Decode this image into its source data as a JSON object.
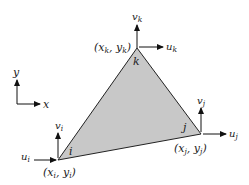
{
  "figure": {
    "colors": {
      "fill": "#c8c8c8",
      "stroke": "#222222",
      "background": "#ffffff"
    }
  },
  "axes": {
    "x_label": "x",
    "y_label": "y"
  },
  "nodes": {
    "i": {
      "label": "i",
      "coord_label": "(x",
      "coord_sub_x": "i",
      "coord_mid": ", y",
      "coord_sub_y": "i",
      "coord_end": ")",
      "u": "u",
      "u_sub": "i",
      "v": "v",
      "v_sub": "i"
    },
    "j": {
      "label": "j",
      "coord_label": "(x",
      "coord_sub_x": "j",
      "coord_mid": ", y",
      "coord_sub_y": "j",
      "coord_end": ")",
      "u": "u",
      "u_sub": "j",
      "v": "v",
      "v_sub": "j"
    },
    "k": {
      "label": "k",
      "coord_label": "(x",
      "coord_sub_x": "k",
      "coord_mid": ", y",
      "coord_sub_y": "k",
      "coord_end": ")",
      "u": "u",
      "u_sub": "k",
      "v": "v",
      "v_sub": "k"
    }
  }
}
